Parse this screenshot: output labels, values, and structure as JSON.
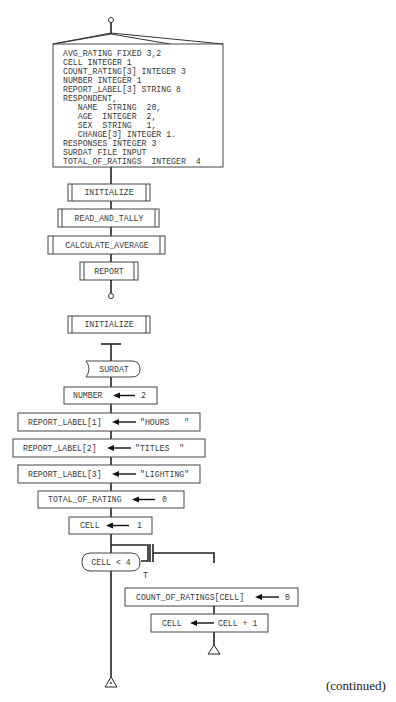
{
  "diagram": {
    "type": "structured-flowchart",
    "main_module": {
      "declarations": [
        "AVG_RATING FIXED 3,2",
        "CELL INTEGER 1",
        "COUNT_RATING[3] INTEGER 3",
        "NUMBER INTEGER 1",
        "REPORT_LABEL[3] STRING 8",
        "RESPONDENT,",
        "   NAME  STRING  20,",
        "   AGE  INTEGER  2,",
        "   SEX  STRING   1,",
        "   CHANGE[3] INTEGER 1.",
        "RESPONSES INTEGER 3",
        "SURDAT FILE INPUT",
        "TOTAL_OF_RATINGS  INTEGER  4"
      ],
      "calls": [
        "INITIALIZE",
        "READ_AND_TALLY",
        "CALCULATE_AVERAGE",
        "REPORT"
      ]
    },
    "initialize_module": {
      "title": "INITIALIZE",
      "file": "SURDAT",
      "assignments": [
        {
          "target": "NUMBER",
          "value": "2"
        },
        {
          "target": "REPORT_LABEL[1]",
          "value": "\"HOURS   \""
        },
        {
          "target": "REPORT_LABEL[2]",
          "value": "\"TITLES  \""
        },
        {
          "target": "REPORT_LABEL[3]",
          "value": "\"LIGHTING\""
        },
        {
          "target": "TOTAL_OF_RATING",
          "value": "0"
        },
        {
          "target": "CELL",
          "value": "1"
        }
      ],
      "loop": {
        "condition": "CELL < 4",
        "true_label": "T",
        "body": [
          {
            "target": "COUNT_OF_RATINGS[CELL]",
            "value": "0"
          },
          {
            "target": "CELL",
            "value": "CELL + 1"
          }
        ]
      }
    },
    "footer": "(continued)"
  }
}
